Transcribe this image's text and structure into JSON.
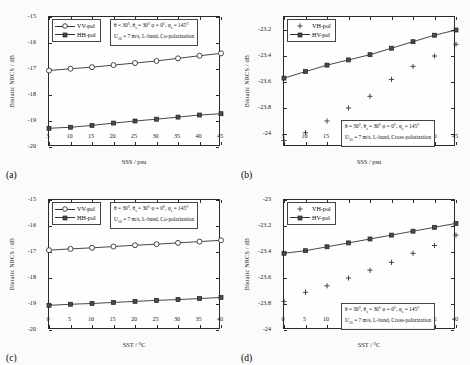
{
  "figure": {
    "background": "#fbfbfb",
    "axis_color": "#2a2a2a"
  },
  "chart_data": [
    {
      "panel": "a",
      "type": "line",
      "title": "",
      "xlabel": "SSS / psu",
      "ylabel": "Bistatic NRCS / dB",
      "xlim": [
        5,
        45
      ],
      "ylim": [
        -20,
        -15
      ],
      "xticks": [
        5,
        10,
        15,
        20,
        25,
        30,
        35,
        40,
        45
      ],
      "yticks": [
        -15,
        -16,
        -17,
        -18,
        -19,
        -20
      ],
      "grid": false,
      "legend_position": "top-left",
      "annotation_line1": "θ = 30°, θs = 30° φ = 0°, φs = 145°",
      "annotation_line2": "U10 = 7 m/s, L-band, Co-polarization",
      "x": [
        5,
        10,
        15,
        20,
        25,
        30,
        35,
        40,
        45
      ],
      "series": [
        {
          "name": "VV-pol",
          "marker": "circle",
          "values": [
            -17.06,
            -16.99,
            -16.93,
            -16.85,
            -16.77,
            -16.69,
            -16.59,
            -16.49,
            -16.4
          ]
        },
        {
          "name": "HH-pol",
          "marker": "square",
          "values": [
            -19.28,
            -19.24,
            -19.17,
            -19.08,
            -19.0,
            -18.93,
            -18.85,
            -18.77,
            -18.72
          ]
        }
      ]
    },
    {
      "panel": "b",
      "type": "line",
      "title": "",
      "xlabel": "SSS / psu",
      "ylabel": "Bistatic NRCS / dB",
      "xlim": [
        5,
        45
      ],
      "ylim": [
        -24.1,
        -23.1
      ],
      "xticks": [
        5,
        10,
        15,
        20,
        25,
        30,
        35,
        40,
        45
      ],
      "yticks": [
        -23.2,
        -23.4,
        -23.6,
        -23.8,
        -24.0
      ],
      "grid": false,
      "legend_position": "top-left",
      "annotation_line1": "θ = 30°, θs = 30° φ = 0°, φs = 145°",
      "annotation_line2": "U10 = 7 m/s, L-band, Cross-polarization",
      "x": [
        5,
        10,
        15,
        20,
        25,
        30,
        35,
        40,
        45
      ],
      "series": [
        {
          "name": "VH-pol",
          "marker": "plus",
          "values": [
            -24.05,
            -23.99,
            -23.9,
            -23.8,
            -23.71,
            -23.58,
            -23.48,
            -23.4,
            -23.31
          ]
        },
        {
          "name": "HV-pol",
          "marker": "square",
          "values": [
            -23.57,
            -23.52,
            -23.47,
            -23.43,
            -23.39,
            -23.34,
            -23.29,
            -23.24,
            -23.2
          ]
        }
      ]
    },
    {
      "panel": "c",
      "type": "line",
      "title": "",
      "xlabel": "SST / °C",
      "ylabel": "Bistatic NRCS / dB",
      "xlim": [
        0,
        40
      ],
      "ylim": [
        -20,
        -15
      ],
      "xticks": [
        0,
        5,
        10,
        15,
        20,
        25,
        30,
        35,
        40
      ],
      "yticks": [
        -15,
        -16,
        -17,
        -18,
        -19,
        -20
      ],
      "grid": false,
      "legend_position": "top-left",
      "annotation_line1": "θ = 30°, θs = 30° φ = 0°, φs = 145°",
      "annotation_line2": "U10 = 7 m/s, L-band, Co-polarization",
      "x": [
        0,
        5,
        10,
        15,
        20,
        25,
        30,
        35,
        40
      ],
      "series": [
        {
          "name": "VV-pol",
          "marker": "circle",
          "values": [
            -16.93,
            -16.88,
            -16.84,
            -16.79,
            -16.74,
            -16.7,
            -16.65,
            -16.6,
            -16.55
          ]
        },
        {
          "name": "HH-pol",
          "marker": "square",
          "values": [
            -19.05,
            -19.01,
            -18.98,
            -18.94,
            -18.9,
            -18.86,
            -18.83,
            -18.79,
            -18.75
          ]
        }
      ]
    },
    {
      "panel": "d",
      "type": "line",
      "title": "",
      "xlabel": "SST / °C",
      "ylabel": "Bistatic NRCS / dB",
      "xlim": [
        0,
        40
      ],
      "ylim": [
        -24,
        -23
      ],
      "xticks": [
        0,
        5,
        10,
        15,
        20,
        25,
        30,
        35,
        40
      ],
      "yticks": [
        -23,
        -23.2,
        -23.4,
        -23.6,
        -23.8,
        -24
      ],
      "grid": false,
      "legend_position": "top-left",
      "annotation_line1": "θ = 30°, θs = 30° φ = 0°, φs = 145°",
      "annotation_line2": "U10 = 7 m/s, L-band, Cross-polarization",
      "x": [
        0,
        5,
        10,
        15,
        20,
        25,
        30,
        35,
        40
      ],
      "series": [
        {
          "name": "VH-pol",
          "marker": "plus",
          "values": [
            -23.78,
            -23.71,
            -23.66,
            -23.6,
            -23.54,
            -23.48,
            -23.41,
            -23.35,
            -23.27
          ]
        },
        {
          "name": "HV-pol",
          "marker": "square",
          "values": [
            -23.41,
            -23.39,
            -23.36,
            -23.33,
            -23.3,
            -23.27,
            -23.24,
            -23.21,
            -23.18
          ]
        }
      ]
    }
  ],
  "panel_tags": {
    "a": "(a)",
    "b": "(b)",
    "c": "(c)",
    "d": "(d)"
  }
}
